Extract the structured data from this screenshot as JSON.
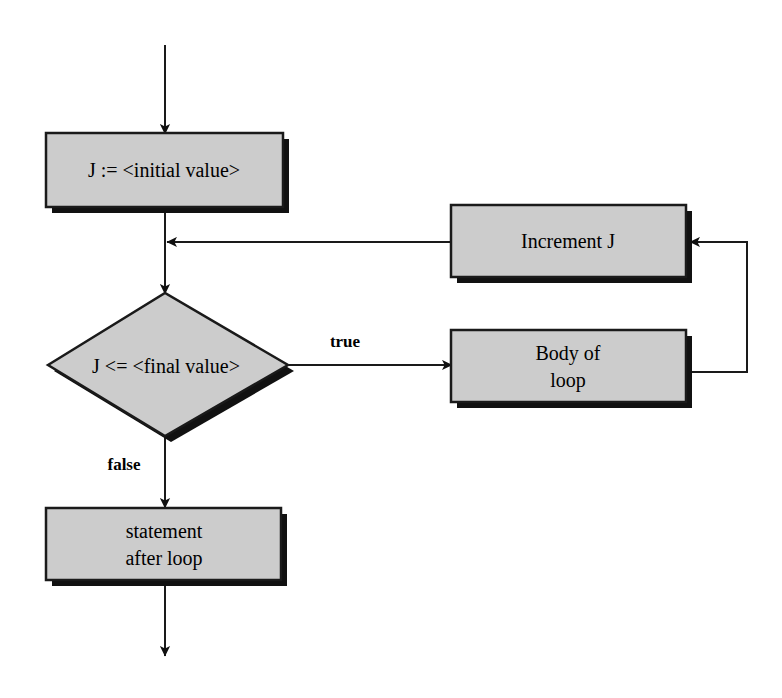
{
  "diagram": {
    "background_color": "#ffffff",
    "shape_fill_color": "#cccccc",
    "shape_border_color": "#1a1a1a",
    "shadow_color": "#111111",
    "nodes": {
      "init": {
        "label": "J := <initial value>",
        "shape": "process"
      },
      "increment": {
        "label": "Increment J",
        "shape": "process"
      },
      "condition": {
        "label": "J <= <final value>",
        "shape": "decision"
      },
      "body_line1": {
        "label": "Body of",
        "shape": "process"
      },
      "body_line2": {
        "label": "loop",
        "shape": "process"
      },
      "after_line1": {
        "label": "statement",
        "shape": "process"
      },
      "after_line2": {
        "label": "after loop",
        "shape": "process"
      }
    },
    "edge_labels": {
      "true": "true",
      "false": "false"
    }
  }
}
